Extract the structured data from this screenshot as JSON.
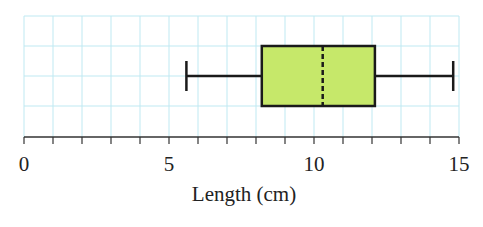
{
  "chart_data": {
    "type": "boxplot",
    "title": "",
    "xlabel": "Length (cm)",
    "ylabel": "",
    "xlim": [
      0,
      15
    ],
    "x_ticks": [
      0,
      5,
      10,
      15
    ],
    "minor_tick_step": 1,
    "grid": true,
    "series": [
      {
        "name": "Length",
        "min": 5.6,
        "q1": 8.2,
        "median": 10.3,
        "q3": 12.1,
        "max": 14.8
      }
    ],
    "colors": {
      "box_fill": "#c6e86a",
      "grid": "#bfe9f2",
      "stroke": "#1a1a1a"
    }
  },
  "labels": {
    "tick_0": "0",
    "tick_5": "5",
    "tick_10": "10",
    "tick_15": "15",
    "xlabel": "Length (cm)"
  }
}
